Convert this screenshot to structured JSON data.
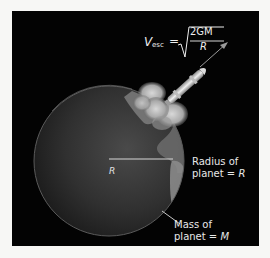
{
  "figure": {
    "background": "#f7f7f5",
    "panel_color": "#030303"
  },
  "formula": {
    "lhs_symbol": "V",
    "lhs_subscript": "esc",
    "equals": "=",
    "numerator": "2GM",
    "denominator": "R"
  },
  "planet": {
    "radius_symbol": "R",
    "radius_label_line1": "Radius of",
    "radius_label_line2_prefix": "planet = ",
    "radius_label_line2_symbol": "R",
    "mass_label_line1": "Mass of",
    "mass_label_line2_prefix": "planet = ",
    "mass_label_line2_symbol": "M"
  },
  "icons": {
    "rocket": "rocket-icon",
    "arrow": "velocity-arrow-icon",
    "planet": "earth-globe-icon",
    "exhaust": "exhaust-cloud-icon"
  }
}
